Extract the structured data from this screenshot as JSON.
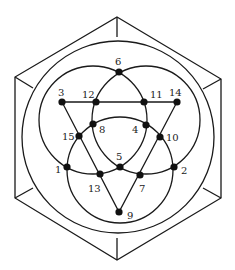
{
  "diagram": {
    "hexagon": {
      "vertices": [
        [
          117,
          17
        ],
        [
          221,
          79
        ],
        [
          221,
          198
        ],
        [
          117,
          260
        ],
        [
          15,
          198
        ],
        [
          15,
          77
        ]
      ],
      "inner_spokes": [
        [
          [
            117,
            17
          ],
          [
            117,
            37
          ]
        ],
        [
          [
            221,
            79
          ],
          [
            203,
            89
          ]
        ],
        [
          [
            221,
            198
          ],
          [
            203,
            188
          ]
        ],
        [
          [
            117,
            260
          ],
          [
            117,
            238
          ]
        ],
        [
          [
            15,
            198
          ],
          [
            33,
            188
          ]
        ],
        [
          [
            15,
            77
          ],
          [
            33,
            88
          ]
        ]
      ]
    },
    "outer_circle": {
      "cx": 118,
      "cy": 137,
      "r": 96
    },
    "circles": [
      {
        "name": "upper-left",
        "cx": 93,
        "cy": 120,
        "r": 54
      },
      {
        "name": "upper-right",
        "cx": 146,
        "cy": 120,
        "r": 54
      },
      {
        "name": "bottom",
        "cx": 120,
        "cy": 170,
        "r": 53
      }
    ],
    "triangle": {
      "points": [
        [
          62,
          102
        ],
        [
          177,
          102
        ],
        [
          119,
          212
        ]
      ]
    },
    "nodes": [
      {
        "id": "1",
        "label": "1",
        "x": 67,
        "y": 167,
        "lx": 55,
        "ly": 173
      },
      {
        "id": "2",
        "label": "2",
        "x": 174,
        "y": 167,
        "lx": 181,
        "ly": 174
      },
      {
        "id": "3",
        "label": "3",
        "x": 62,
        "y": 102,
        "lx": 58,
        "ly": 96
      },
      {
        "id": "4",
        "label": "4",
        "x": 146,
        "y": 125,
        "lx": 132,
        "ly": 133
      },
      {
        "id": "5",
        "label": "5",
        "x": 120,
        "y": 167,
        "lx": 116,
        "ly": 160
      },
      {
        "id": "6",
        "label": "6",
        "x": 119,
        "y": 72,
        "lx": 115,
        "ly": 65
      },
      {
        "id": "7",
        "label": "7",
        "x": 140,
        "y": 175,
        "lx": 139,
        "ly": 192
      },
      {
        "id": "8",
        "label": "8",
        "x": 93,
        "y": 124,
        "lx": 99,
        "ly": 133
      },
      {
        "id": "9",
        "label": "9",
        "x": 119,
        "y": 212,
        "lx": 127,
        "ly": 219
      },
      {
        "id": "10",
        "label": "10",
        "x": 160,
        "y": 137,
        "lx": 166,
        "ly": 141
      },
      {
        "id": "11",
        "label": "11",
        "x": 144,
        "y": 102,
        "lx": 150,
        "ly": 98
      },
      {
        "id": "12",
        "label": "12",
        "x": 96,
        "y": 102,
        "lx": 82,
        "ly": 98
      },
      {
        "id": "13",
        "label": "13",
        "x": 100,
        "y": 174,
        "lx": 88,
        "ly": 192
      },
      {
        "id": "14",
        "label": "14",
        "x": 177,
        "y": 102,
        "lx": 169,
        "ly": 96
      },
      {
        "id": "15",
        "label": "15",
        "x": 79,
        "y": 136,
        "lx": 62,
        "ly": 140
      }
    ]
  }
}
